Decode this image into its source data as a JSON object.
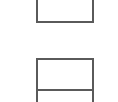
{
  "diagram": {
    "line_color": "#5a5a5a",
    "background": "#ffffff",
    "boxes": [
      {
        "id": "top-box",
        "label": ""
      },
      {
        "id": "bottom-box",
        "label": "",
        "sections": 2
      }
    ]
  }
}
